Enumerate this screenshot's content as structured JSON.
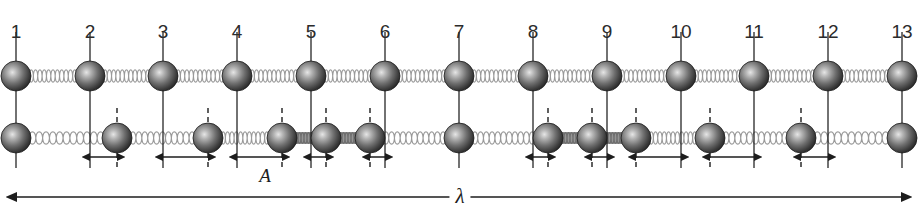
{
  "figure": {
    "width": 921,
    "height": 215,
    "background": "#ffffff"
  },
  "colors": {
    "sphere_dark": "#2e2e2e",
    "sphere_mid": "#6d6d6d",
    "sphere_light": "#d8d8d8",
    "spring": "#9a9a9a",
    "spring_compressed": "#8a8a8a",
    "line": "#1d1d1d",
    "dashed": "#1d1d1d",
    "text": "#2b2b2b"
  },
  "numbers": {
    "row_label": "particle index",
    "labels": [
      "1",
      "2",
      "3",
      "4",
      "5",
      "6",
      "7",
      "8",
      "9",
      "10",
      "11",
      "12",
      "13"
    ],
    "x": [
      16,
      90,
      163,
      237,
      311,
      385,
      459,
      533,
      607,
      681,
      754,
      828,
      902
    ],
    "y": 22
  },
  "rows": {
    "equilibrium": {
      "name": "equilibrium-row",
      "cy": 76,
      "radius": 15,
      "x": [
        16,
        90,
        163,
        237,
        311,
        385,
        459,
        533,
        607,
        681,
        754,
        828,
        902
      ]
    },
    "displaced": {
      "name": "displaced-row",
      "cy": 138,
      "radius": 15,
      "x": [
        16,
        117,
        208,
        282,
        326,
        370,
        459,
        548,
        592,
        636,
        710,
        801,
        902
      ],
      "displacements": [
        0,
        27,
        45,
        45,
        15,
        -15,
        0,
        15,
        -15,
        -45,
        -44,
        -27,
        0
      ]
    }
  },
  "amplitude_arrows": {
    "label": "A",
    "label_x": 265,
    "label_y": 166,
    "y": 157,
    "items": [
      {
        "from": 90,
        "to": 117,
        "name": "amplitude-arrow-2"
      },
      {
        "from": 163,
        "to": 208,
        "name": "amplitude-arrow-3"
      },
      {
        "from": 237,
        "to": 282,
        "name": "amplitude-arrow-4"
      },
      {
        "from": 311,
        "to": 326,
        "name": "amplitude-arrow-5"
      },
      {
        "from": 370,
        "to": 385,
        "name": "amplitude-arrow-6"
      },
      {
        "from": 533,
        "to": 548,
        "name": "amplitude-arrow-8"
      },
      {
        "from": 592,
        "to": 607,
        "name": "amplitude-arrow-9"
      },
      {
        "from": 636,
        "to": 681,
        "name": "amplitude-arrow-10"
      },
      {
        "from": 710,
        "to": 754,
        "name": "amplitude-arrow-11"
      },
      {
        "from": 801,
        "to": 828,
        "name": "amplitude-arrow-12"
      }
    ]
  },
  "wavelength_arrow": {
    "label": "λ",
    "label_x": 460,
    "label_y": 186,
    "y": 197,
    "from": 17,
    "to": 901
  },
  "vertical_lines": {
    "name": "equilibrium-guide-lines",
    "top": 32,
    "bottom": 168
  },
  "dashed_lines": {
    "name": "displacement-guide-lines",
    "top": 108,
    "bottom": 168
  },
  "chart_data": {
    "type": "scatter",
    "xlabel": "particle number",
    "ylabel": "displacement",
    "categories": [
      "1",
      "2",
      "3",
      "4",
      "5",
      "6",
      "7",
      "8",
      "9",
      "10",
      "11",
      "12",
      "13"
    ],
    "series": [
      {
        "name": "displacement (px)",
        "values": [
          0,
          27,
          45,
          45,
          15,
          -15,
          0,
          15,
          -15,
          -45,
          -44,
          -27,
          0
        ]
      }
    ],
    "annotations": [
      "A",
      "λ"
    ],
    "grid": false,
    "legend": "none"
  }
}
